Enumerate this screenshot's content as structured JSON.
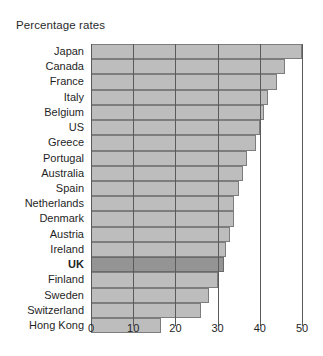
{
  "chart_data": {
    "type": "bar",
    "orientation": "horizontal",
    "title": "Percentage rates",
    "xlabel": "",
    "ylabel": "",
    "xlim": [
      0,
      50
    ],
    "xticks": [
      0,
      10,
      20,
      30,
      40,
      50
    ],
    "grid": true,
    "legend": false,
    "highlight_category": "UK",
    "colors": {
      "bar_fill": "#bdbdbd",
      "bar_stroke": "#7d7d7d",
      "highlight_fill": "#949494",
      "highlight_stroke": "#6a6a6a",
      "gridline": "#5a5a5a",
      "text": "#1f1f1f"
    },
    "categories": [
      "Japan",
      "Canada",
      "France",
      "Italy",
      "Belgium",
      "US",
      "Greece",
      "Portugal",
      "Australia",
      "Spain",
      "Netherlands",
      "Denmark",
      "Austria",
      "Ireland",
      "UK",
      "Finland",
      "Sweden",
      "Switzerland",
      "Hong Kong"
    ],
    "values": [
      50,
      46,
      44,
      42,
      41,
      40,
      39,
      37,
      36,
      35,
      34,
      34,
      33,
      32,
      31.5,
      30,
      28,
      26,
      16.5
    ]
  }
}
